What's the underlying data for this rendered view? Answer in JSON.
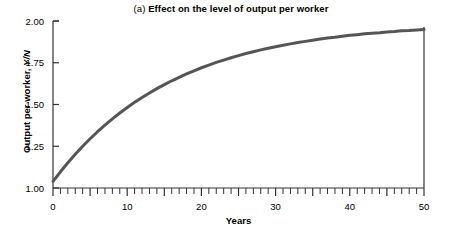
{
  "chart_data": {
    "type": "line",
    "title": "(a) Effect on the level of output per worker",
    "title_prefix": "(a) ",
    "title_main": "Effect on the level of output per worker",
    "xlabel": "Years",
    "ylabel": "Output per worker, Y/N",
    "ylabel_text": "Output per worker, ",
    "ylabel_symbol": "Y/N",
    "xlim": [
      0,
      50
    ],
    "ylim": [
      1.0,
      2.0
    ],
    "grid": false,
    "legend": "none",
    "line_color": "#555555",
    "axis_color": "#333333",
    "background": "#ffffff",
    "x_ticks_major": [
      0,
      10,
      20,
      30,
      40,
      50
    ],
    "x_tick_labels": [
      "0",
      "10",
      "20",
      "30",
      "40",
      "50"
    ],
    "x_minor_tick_step": 1,
    "y_ticks": [
      1.0,
      1.25,
      1.5,
      1.75,
      2.0
    ],
    "y_tick_labels": [
      "1.00",
      "1.25",
      "1.50",
      "1.75",
      "2.00"
    ],
    "series": [
      {
        "name": "Output per worker",
        "x": [
          0,
          1,
          2,
          3,
          4,
          5,
          6,
          7,
          8,
          9,
          10,
          11,
          12,
          13,
          14,
          15,
          16,
          17,
          18,
          19,
          20,
          21,
          22,
          23,
          24,
          25,
          26,
          27,
          28,
          29,
          30,
          31,
          32,
          33,
          34,
          35,
          36,
          37,
          38,
          39,
          40,
          41,
          42,
          43,
          44,
          45,
          46,
          47,
          48,
          49,
          50
        ],
        "values": [
          1.04,
          1.097,
          1.151,
          1.202,
          1.25,
          1.295,
          1.337,
          1.377,
          1.414,
          1.449,
          1.482,
          1.513,
          1.542,
          1.569,
          1.595,
          1.619,
          1.642,
          1.663,
          1.683,
          1.702,
          1.72,
          1.736,
          1.752,
          1.766,
          1.78,
          1.793,
          1.805,
          1.816,
          1.827,
          1.837,
          1.846,
          1.855,
          1.863,
          1.871,
          1.878,
          1.885,
          1.892,
          1.898,
          1.903,
          1.909,
          1.914,
          1.918,
          1.923,
          1.927,
          1.93,
          1.934,
          1.937,
          1.941,
          1.943,
          1.946,
          1.949
        ]
      }
    ],
    "annotations": []
  }
}
